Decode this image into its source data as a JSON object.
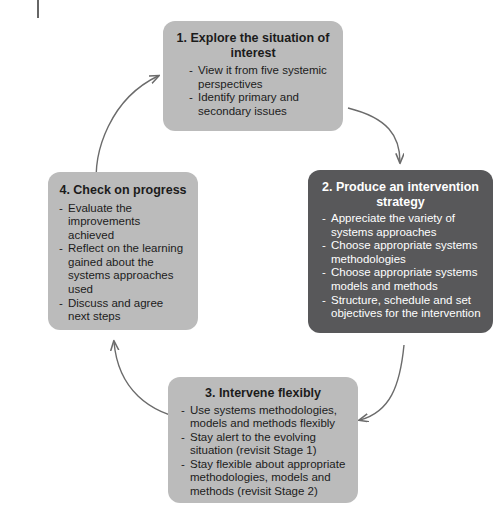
{
  "diagram": {
    "colors": {
      "light_box": "#bbbbbb",
      "dark_box": "#58585a",
      "light_text": "#1b1b1b",
      "dark_text": "#ffffff",
      "arrow": "#6b6b6b",
      "background": "#ffffff"
    },
    "stages": [
      {
        "id": "stage-1",
        "title": "1. Explore the situation of interest",
        "style": "light",
        "bullets": [
          "View it from five systemic perspectives",
          "Identify primary and secondary issues"
        ]
      },
      {
        "id": "stage-2",
        "title": "2. Produce an intervention strategy",
        "style": "dark",
        "bullets": [
          "Appreciate the variety of systems approaches",
          "Choose appropriate systems methodologies",
          "Choose appropriate systems models and methods",
          "Structure, schedule and set objectives for the intervention"
        ]
      },
      {
        "id": "stage-3",
        "title": "3. Intervene flexibly",
        "style": "light",
        "bullets": [
          "Use systems methodologies, models and methods flexibly",
          "Stay alert to the evolving situation (revisit Stage 1)",
          "Stay flexible about appropriate methodologies, models and methods (revisit Stage 2)"
        ]
      },
      {
        "id": "stage-4",
        "title": "4. Check on progress",
        "style": "light",
        "bullets": [
          "Evaluate the improvements achieved",
          "Reflect on the  learning gained about the systems approaches used",
          "Discuss and agree next steps"
        ]
      }
    ],
    "arrows": [
      {
        "id": "arrow-1-to-2",
        "from": "stage-1",
        "to": "stage-2",
        "direction": "clockwise"
      },
      {
        "id": "arrow-2-to-3",
        "from": "stage-2",
        "to": "stage-3",
        "direction": "clockwise"
      },
      {
        "id": "arrow-3-to-4",
        "from": "stage-3",
        "to": "stage-4",
        "direction": "clockwise"
      },
      {
        "id": "arrow-4-to-1",
        "from": "stage-4",
        "to": "stage-1",
        "direction": "clockwise"
      }
    ],
    "bullet_marker": "-"
  }
}
